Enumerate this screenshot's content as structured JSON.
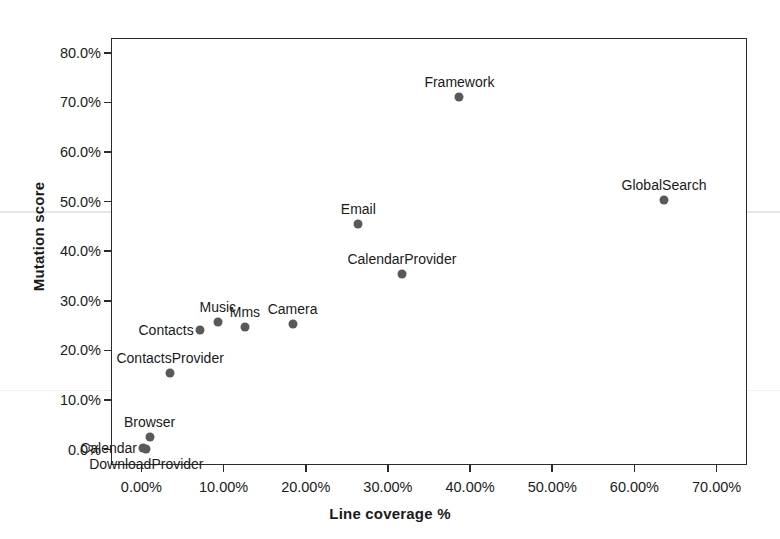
{
  "chart_data": {
    "type": "scatter",
    "title": "",
    "xlabel": "Line coverage %",
    "ylabel": "Mutation score",
    "xlim": [
      -3.7,
      73.7
    ],
    "ylim": [
      -3.1,
      83.0
    ],
    "grid": false,
    "legend": "none",
    "point_color": "#595959",
    "xticks": [
      "0.00%",
      "10.00%",
      "20.00%",
      "30.00%",
      "40.00%",
      "50.00%",
      "60.00%",
      "70.00%"
    ],
    "xtick_values": [
      0,
      10,
      20,
      30,
      40,
      50,
      60,
      70
    ],
    "yticks": [
      "0.0%",
      "10.0%",
      "20.0%",
      "30.0%",
      "40.0%",
      "50.0%",
      "60.0%",
      "70.0%",
      "80.0%"
    ],
    "ytick_values": [
      0,
      10,
      20,
      30,
      40,
      50,
      60,
      70,
      80
    ],
    "points": [
      {
        "label": "Calendar",
        "x": 0.2,
        "y": 0.4,
        "label_pos": "left"
      },
      {
        "label": "DownloadProvider",
        "x": 0.6,
        "y": 0.2,
        "label_pos": "below"
      },
      {
        "label": "Browser",
        "x": 1.0,
        "y": 2.6,
        "label_pos": "above"
      },
      {
        "label": "ContactsProvider",
        "x": 3.5,
        "y": 15.5,
        "label_pos": "above"
      },
      {
        "label": "Contacts",
        "x": 7.1,
        "y": 24.2,
        "label_pos": "left"
      },
      {
        "label": "Music",
        "x": 9.3,
        "y": 25.8,
        "label_pos": "above"
      },
      {
        "label": "Mms",
        "x": 12.6,
        "y": 24.8,
        "label_pos": "above"
      },
      {
        "label": "Camera",
        "x": 18.4,
        "y": 25.3,
        "label_pos": "above"
      },
      {
        "label": "Email",
        "x": 26.4,
        "y": 45.5,
        "label_pos": "above"
      },
      {
        "label": "CalendarProvider",
        "x": 31.7,
        "y": 35.5,
        "label_pos": "above"
      },
      {
        "label": "Framework",
        "x": 38.7,
        "y": 71.2,
        "label_pos": "above"
      },
      {
        "label": "GlobalSearch",
        "x": 63.6,
        "y": 50.4,
        "label_pos": "above"
      }
    ]
  }
}
